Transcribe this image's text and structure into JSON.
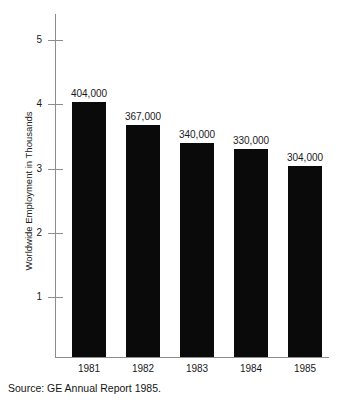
{
  "chart_data": {
    "type": "bar",
    "title": "",
    "subtitle": "",
    "xlabel": "",
    "ylabel": "Worldwide Employment in Thousands",
    "categories": [
      "1981",
      "1982",
      "1983",
      "1984",
      "1985"
    ],
    "values": [
      404,
      367,
      340,
      330,
      304
    ],
    "data_labels": [
      "404,000",
      "367,000",
      "340,000",
      "330,000",
      "304,000"
    ],
    "ylim": [
      0,
      5.4
    ],
    "ytick_values": [
      1,
      2,
      3,
      4,
      5
    ],
    "ytick_labels": [
      "1",
      "2",
      "3",
      "4",
      "5"
    ],
    "grid": false,
    "legend": null,
    "bar_color": "#0a0a0a",
    "axis_color": "#8d8d8d",
    "text_color": "#1a1a1a",
    "annotations": [
      "Source: GE Annual Report 1985."
    ]
  },
  "caption": {
    "source": "Source: GE Annual Report 1985."
  }
}
